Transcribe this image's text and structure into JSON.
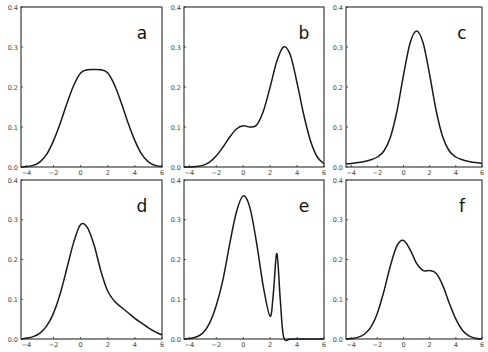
{
  "figure": {
    "panel_labels": [
      "a",
      "b",
      "c",
      "d",
      "e",
      "f"
    ]
  },
  "chart_data": [
    {
      "type": "line",
      "panel": "a",
      "title": "a",
      "xlabel": "",
      "ylabel": "",
      "xlim": [
        -4.4,
        6
      ],
      "ylim": [
        0,
        0.4
      ],
      "xticks": [
        -4,
        -2,
        0,
        2,
        4,
        6
      ],
      "yticks": [
        0.0,
        0.1,
        0.2,
        0.3,
        0.4
      ],
      "grid": false,
      "x": [
        -4.4,
        -4,
        -3.5,
        -3,
        -2.5,
        -2,
        -1.5,
        -1,
        -0.5,
        0,
        0.5,
        1,
        1.5,
        2,
        2.5,
        3,
        3.5,
        4,
        4.5,
        5,
        5.5,
        6
      ],
      "y": [
        0.0,
        0.001,
        0.004,
        0.013,
        0.032,
        0.066,
        0.11,
        0.16,
        0.205,
        0.235,
        0.243,
        0.244,
        0.243,
        0.235,
        0.205,
        0.16,
        0.11,
        0.066,
        0.032,
        0.013,
        0.004,
        0.001
      ]
    },
    {
      "type": "line",
      "panel": "b",
      "title": "b",
      "xlabel": "",
      "ylabel": "",
      "xlim": [
        -4.4,
        6
      ],
      "ylim": [
        0,
        0.4
      ],
      "xticks": [
        -4,
        -2,
        0,
        2,
        4,
        6
      ],
      "yticks": [
        0.0,
        0.1,
        0.2,
        0.3,
        0.4
      ],
      "grid": false,
      "x": [
        -4.4,
        -4,
        -3.5,
        -3,
        -2.5,
        -2,
        -1.5,
        -1,
        -0.5,
        0,
        0.5,
        1,
        1.5,
        2,
        2.5,
        3,
        3.5,
        4,
        4.5,
        5,
        5.5,
        6
      ],
      "y": [
        0.0,
        0.0,
        0.001,
        0.004,
        0.012,
        0.028,
        0.05,
        0.075,
        0.095,
        0.103,
        0.1,
        0.105,
        0.14,
        0.2,
        0.265,
        0.3,
        0.28,
        0.21,
        0.13,
        0.065,
        0.025,
        0.008
      ]
    },
    {
      "type": "line",
      "panel": "c",
      "title": "c",
      "xlabel": "",
      "ylabel": "",
      "xlim": [
        -4.4,
        6
      ],
      "ylim": [
        0,
        0.4
      ],
      "xticks": [
        -4,
        -2,
        0,
        2,
        4,
        6
      ],
      "yticks": [
        0.0,
        0.1,
        0.2,
        0.3,
        0.4
      ],
      "grid": false,
      "x": [
        -4.4,
        -4,
        -3.5,
        -3,
        -2.5,
        -2,
        -1.5,
        -1,
        -0.5,
        0,
        0.5,
        1,
        1.5,
        2,
        2.5,
        3,
        3.5,
        4,
        4.5,
        5,
        5.5,
        6
      ],
      "y": [
        0.008,
        0.009,
        0.011,
        0.014,
        0.018,
        0.025,
        0.04,
        0.075,
        0.14,
        0.23,
        0.31,
        0.34,
        0.31,
        0.23,
        0.14,
        0.075,
        0.04,
        0.025,
        0.018,
        0.014,
        0.011,
        0.009
      ]
    },
    {
      "type": "line",
      "panel": "d",
      "title": "d",
      "xlabel": "",
      "ylabel": "",
      "xlim": [
        -4.4,
        6
      ],
      "ylim": [
        0,
        0.4
      ],
      "xticks": [
        -4,
        -2,
        0,
        2,
        4,
        6
      ],
      "yticks": [
        0.0,
        0.1,
        0.2,
        0.3,
        0.4
      ],
      "grid": false,
      "x": [
        -4.4,
        -4,
        -3.5,
        -3,
        -2.5,
        -2,
        -1.5,
        -1,
        -0.5,
        0,
        0.5,
        1,
        1.5,
        2,
        2.5,
        3,
        3.5,
        4,
        4.5,
        5,
        5.5,
        6
      ],
      "y": [
        0.0,
        0.002,
        0.006,
        0.015,
        0.033,
        0.065,
        0.115,
        0.18,
        0.245,
        0.288,
        0.28,
        0.235,
        0.17,
        0.12,
        0.095,
        0.08,
        0.066,
        0.052,
        0.04,
        0.028,
        0.018,
        0.01
      ]
    },
    {
      "type": "line",
      "panel": "e",
      "title": "e",
      "xlabel": "",
      "ylabel": "",
      "xlim": [
        -4.4,
        6
      ],
      "ylim": [
        0,
        0.4
      ],
      "xticks": [
        -4,
        -2,
        0,
        2,
        4,
        6
      ],
      "yticks": [
        0.0,
        0.1,
        0.2,
        0.3,
        0.4
      ],
      "grid": false,
      "x": [
        -4.4,
        -4,
        -3.5,
        -3,
        -2.5,
        -2,
        -1.5,
        -1,
        -0.5,
        0,
        0.5,
        1,
        1.5,
        2,
        2.25,
        2.5,
        2.75,
        3,
        3.5,
        4,
        5,
        6
      ],
      "y": [
        0.0,
        0.001,
        0.005,
        0.015,
        0.04,
        0.085,
        0.15,
        0.24,
        0.32,
        0.36,
        0.33,
        0.24,
        0.13,
        0.057,
        0.12,
        0.215,
        0.1,
        0.005,
        0.0,
        0.0,
        0.0,
        0.0
      ]
    },
    {
      "type": "line",
      "panel": "f",
      "title": "f",
      "xlabel": "",
      "ylabel": "",
      "xlim": [
        -4.4,
        6
      ],
      "ylim": [
        0,
        0.4
      ],
      "xticks": [
        -4,
        -2,
        0,
        2,
        4,
        6
      ],
      "yticks": [
        0.0,
        0.1,
        0.2,
        0.3,
        0.4
      ],
      "grid": false,
      "x": [
        -4.4,
        -4,
        -3.5,
        -3,
        -2.5,
        -2,
        -1.5,
        -1,
        -0.5,
        0,
        0.5,
        1,
        1.5,
        2,
        2.5,
        3,
        3.5,
        4,
        4.5,
        5,
        5.5,
        6
      ],
      "y": [
        0.0,
        0.001,
        0.004,
        0.012,
        0.03,
        0.065,
        0.12,
        0.185,
        0.235,
        0.248,
        0.225,
        0.19,
        0.172,
        0.172,
        0.165,
        0.135,
        0.09,
        0.05,
        0.022,
        0.008,
        0.002,
        0.0
      ]
    }
  ],
  "style": {
    "line_color": "#1a1a1a",
    "frame_color": "#2a2a2a",
    "tick_label_color": "#444444",
    "background": "#ffffff"
  }
}
